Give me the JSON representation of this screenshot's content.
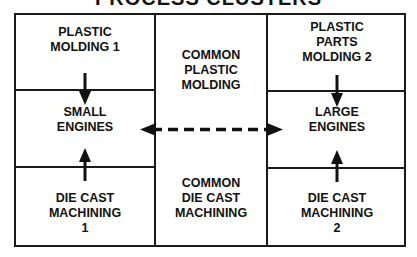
{
  "title": "PROCESS CLUSTERS",
  "cells": {
    "plastic_molding_1": "PLASTIC\nMOLDING 1",
    "small_engines": "SMALL\nENGINES",
    "die_cast_machining_1": "DIE CAST\nMACHINING\n1",
    "common_plastic_molding": "COMMON\nPLASTIC\nMOLDING",
    "common_die_cast_machining": "COMMON\nDIE CAST\nMACHINING",
    "plastic_parts_molding_2": "PLASTIC\nPARTS\nMOLDING 2",
    "large_engines": "LARGE\nENGINES",
    "die_cast_machining_2": "DIE CAST\nMACHINING\n2"
  },
  "connections": [
    {
      "from": "PLASTIC MOLDING 1",
      "to": "SMALL ENGINES",
      "style": "solid"
    },
    {
      "from": "DIE CAST MACHINING 1",
      "to": "SMALL ENGINES",
      "style": "solid"
    },
    {
      "from": "PLASTIC PARTS MOLDING 2",
      "to": "LARGE ENGINES",
      "style": "solid"
    },
    {
      "from": "DIE CAST MACHINING 2",
      "to": "LARGE ENGINES",
      "style": "solid"
    },
    {
      "from": "SMALL ENGINES",
      "to": "LARGE ENGINES",
      "style": "dashed",
      "bidirectional": true
    }
  ]
}
